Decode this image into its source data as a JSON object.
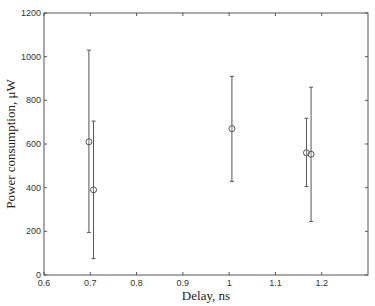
{
  "chart_data": {
    "type": "scatter",
    "subtype": "errorbar",
    "title": "",
    "xlabel": "Delay, ns",
    "ylabel": "Power consumption, μW",
    "xlim": [
      0.6,
      1.3
    ],
    "ylim": [
      0,
      1200
    ],
    "xticks": [
      0.6,
      0.7,
      0.8,
      0.9,
      1.0,
      1.1,
      1.2
    ],
    "xtick_labels": [
      "0.6",
      "0.7",
      "0.8",
      "0.9",
      "1",
      "1.1",
      "1.2"
    ],
    "yticks": [
      0,
      200,
      400,
      600,
      800,
      1000,
      1200
    ],
    "ytick_labels": [
      "0",
      "200",
      "400",
      "600",
      "800",
      "1000",
      "1200"
    ],
    "grid": false,
    "legend": null,
    "marker": "circle",
    "series": [
      {
        "name": "",
        "points": [
          {
            "x": 0.697,
            "y": 610,
            "ymin": 195,
            "ymax": 1030
          },
          {
            "x": 0.707,
            "y": 390,
            "ymin": 75,
            "ymax": 705
          },
          {
            "x": 1.006,
            "y": 670,
            "ymin": 428,
            "ymax": 910
          },
          {
            "x": 1.167,
            "y": 560,
            "ymin": 405,
            "ymax": 718
          },
          {
            "x": 1.177,
            "y": 553,
            "ymin": 245,
            "ymax": 860
          }
        ]
      }
    ]
  },
  "colors": {
    "axis": "#555555",
    "errorbar": "#555555",
    "marker": "#555555"
  }
}
